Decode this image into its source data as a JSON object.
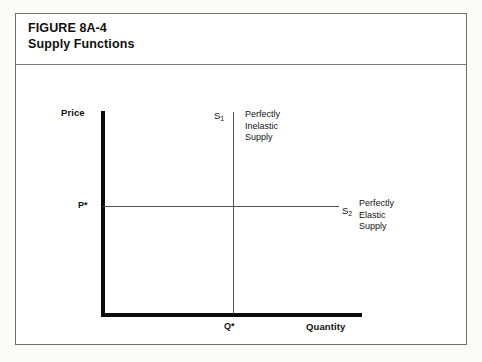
{
  "figure": {
    "title_number": "FIGURE 8A-4",
    "title_name": "Supply Functions"
  },
  "chart_data": {
    "type": "line",
    "title": "Supply Functions",
    "xlabel": "Quantity",
    "ylabel": "Price",
    "grid": false,
    "legend": "inline-annotations",
    "axis_ticks": {
      "x": [
        "Q*"
      ],
      "y": [
        "P*"
      ]
    },
    "series": [
      {
        "name": "S1",
        "label": "S",
        "subscript": "1",
        "description_lines": [
          "Perfectly",
          "Inelastic",
          "Supply"
        ],
        "orientation": "vertical",
        "at": "Q*",
        "points": [
          [
            1,
            0
          ],
          [
            1,
            1
          ]
        ]
      },
      {
        "name": "S2",
        "label": "S",
        "subscript": "2",
        "description_lines": [
          "Perfectly",
          "Elastic",
          "Supply"
        ],
        "orientation": "horizontal",
        "at": "P*",
        "points": [
          [
            0,
            0.5
          ],
          [
            1.8,
            0.5
          ]
        ]
      }
    ]
  }
}
